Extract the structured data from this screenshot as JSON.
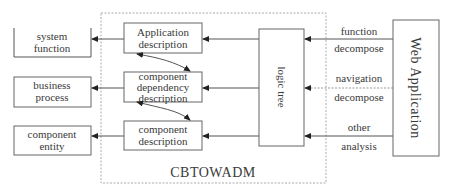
{
  "diagram": {
    "container_label": "CBTOWADM",
    "left_boxes": [
      {
        "line1": "system",
        "line2": "function"
      },
      {
        "line1": "business",
        "line2": "process"
      },
      {
        "line1": "component",
        "line2": "entity"
      }
    ],
    "inner_boxes": [
      {
        "line1": "Application",
        "line2": "description",
        "line3": ""
      },
      {
        "line1": "component",
        "line2": "dependency",
        "line3": "description"
      },
      {
        "line1": "component",
        "line2": "description",
        "line3": ""
      }
    ],
    "logic_tree": "logic tree",
    "source": "Web Application",
    "edge_labels": [
      {
        "top": "function",
        "bottom": "decompose"
      },
      {
        "top": "navigation",
        "bottom": "decompose"
      },
      {
        "top": "other",
        "bottom": "analysis"
      }
    ]
  }
}
